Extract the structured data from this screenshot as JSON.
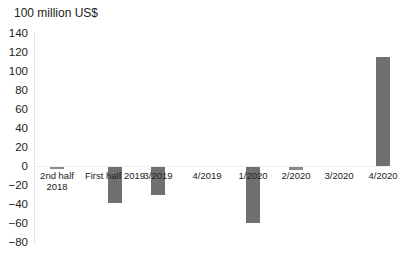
{
  "chart_data": {
    "type": "bar",
    "title": "",
    "unit_label": "100 million US$",
    "xlabel": "",
    "ylabel": "100 million US$",
    "ylim": [
      -80,
      140
    ],
    "yticks": [
      140,
      120,
      100,
      80,
      60,
      40,
      20,
      0,
      -20,
      -40,
      -60,
      -80
    ],
    "ytick_labels": [
      "140",
      "120",
      "100",
      "80",
      "60",
      "40",
      "20",
      "0",
      "−20",
      "−40",
      "−60",
      "−80"
    ],
    "categories": [
      "2nd half 2018",
      "First half 2019",
      "3/2019",
      "4/2019",
      "1/2020",
      "2/2020",
      "3/2020",
      "4/2020"
    ],
    "category_labels": [
      [
        "2nd half",
        "2018"
      ],
      [
        "First half 2019"
      ],
      [
        "3/2019"
      ],
      [
        "4/2019"
      ],
      [
        "1/2020"
      ],
      [
        "2/2020"
      ],
      [
        "3/2020"
      ],
      [
        "4/2020"
      ]
    ],
    "values": [
      -1,
      -38,
      -29,
      0,
      -59,
      -3,
      0,
      115
    ],
    "bar_color": "#707070",
    "grid": false,
    "legend": null
  }
}
